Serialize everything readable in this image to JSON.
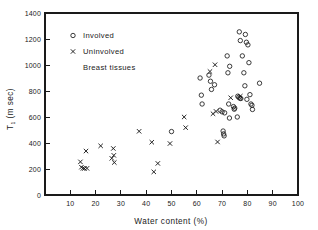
{
  "chart_data": {
    "type": "scatter",
    "title": "",
    "annotation": "Breast tissues",
    "xlabel": "Water content (%)",
    "ylabel": "T₁ (m sec)",
    "ylabel_main": "T",
    "ylabel_sub": "1",
    "ylabel_unit": "(m sec)",
    "xlim": [
      0,
      100
    ],
    "ylim": [
      0,
      1400
    ],
    "xticks": [
      10,
      20,
      30,
      40,
      50,
      60,
      70,
      80,
      90,
      100
    ],
    "yticks": [
      0,
      200,
      400,
      600,
      800,
      1000,
      1200,
      1400
    ],
    "xtick_labels": [
      "10",
      "20",
      "30",
      "40",
      "50",
      "60",
      "70",
      "80",
      "90",
      "100"
    ],
    "ytick_labels": [
      "0",
      "200",
      "400",
      "600",
      "800",
      "1000",
      "1200",
      "1400"
    ],
    "grid": false,
    "legend_position": "upper-left",
    "legend": [
      {
        "label": "Involved",
        "marker": "circle"
      },
      {
        "label": "Uninvolved",
        "marker": "x"
      }
    ],
    "series": [
      {
        "name": "Involved",
        "marker": "circle",
        "points": [
          [
            50.0,
            488
          ],
          [
            61.3,
            900
          ],
          [
            61.8,
            768
          ],
          [
            62.1,
            700
          ],
          [
            64.8,
            922
          ],
          [
            65.4,
            875
          ],
          [
            67.0,
            848
          ],
          [
            65.8,
            812
          ],
          [
            69.2,
            652
          ],
          [
            70.0,
            640
          ],
          [
            71.0,
            632
          ],
          [
            70.4,
            492
          ],
          [
            70.6,
            470
          ],
          [
            70.8,
            455
          ],
          [
            72.0,
            1070
          ],
          [
            72.3,
            940
          ],
          [
            73.0,
            990
          ],
          [
            72.6,
            700
          ],
          [
            72.9,
            592
          ],
          [
            74.5,
            680
          ],
          [
            75.0,
            668
          ],
          [
            76.2,
            760
          ],
          [
            76.6,
            752
          ],
          [
            77.0,
            745
          ],
          [
            77.4,
            742
          ],
          [
            76.8,
            1255
          ],
          [
            77.2,
            1188
          ],
          [
            78.0,
            1070
          ],
          [
            78.6,
            940
          ],
          [
            79.2,
            1235
          ],
          [
            79.6,
            1175
          ],
          [
            79.0,
            840
          ],
          [
            79.8,
            736
          ],
          [
            80.2,
            1155
          ],
          [
            80.6,
            1018
          ],
          [
            81.0,
            772
          ],
          [
            81.4,
            700
          ],
          [
            81.8,
            690
          ],
          [
            82.0,
            658
          ],
          [
            76.0,
            600
          ],
          [
            74.8,
            660
          ],
          [
            84.8,
            860
          ]
        ]
      },
      {
        "name": "Uninvolved",
        "marker": "x",
        "points": [
          [
            14.0,
            255
          ],
          [
            14.4,
            214
          ],
          [
            15.0,
            205
          ],
          [
            15.6,
            204
          ],
          [
            16.6,
            205
          ],
          [
            16.2,
            338
          ],
          [
            22.0,
            378
          ],
          [
            27.0,
            358
          ],
          [
            27.2,
            305
          ],
          [
            27.4,
            250
          ],
          [
            26.4,
            282
          ],
          [
            37.2,
            490
          ],
          [
            42.2,
            406
          ],
          [
            43.0,
            178
          ],
          [
            44.6,
            243
          ],
          [
            49.4,
            396
          ],
          [
            55.0,
            600
          ],
          [
            55.6,
            518
          ],
          [
            65.2,
            950
          ],
          [
            67.2,
            1002
          ],
          [
            66.4,
            625
          ],
          [
            67.6,
            643
          ],
          [
            68.2,
            408
          ],
          [
            77.2,
            760
          ],
          [
            73.4,
            748
          ]
        ]
      }
    ]
  }
}
